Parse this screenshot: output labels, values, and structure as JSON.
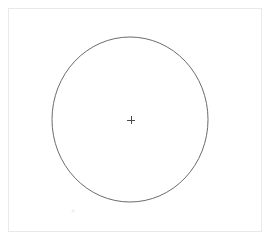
{
  "app": {
    "title": "Drawing Canvas",
    "background_color": "#ffffff"
  },
  "canvas": {
    "name": "drawing-canvas",
    "x": 8,
    "y": 8,
    "width": 254,
    "height": 224,
    "fill_color": "#ffffff",
    "border_color": "#e9e9e9",
    "border_width": 1
  },
  "shapes": [
    {
      "type": "ellipse",
      "name": "circle-shape",
      "label": "Circle",
      "center_x": 130,
      "center_y": 119.5,
      "radius_x": 78,
      "radius_y": 82.5,
      "stroke_color": "#5a5a5a",
      "stroke_width": 0.9,
      "fill": "none"
    },
    {
      "type": "crosshair",
      "name": "center-crosshair",
      "label": "+",
      "center_x": 131,
      "center_y": 120,
      "arm_length": 4,
      "stroke_color": "#4a4a4a",
      "stroke_width": 1
    },
    {
      "type": "dot",
      "name": "faint-speck",
      "center_x": 73,
      "center_y": 211,
      "radius": 1.6,
      "fill_color": "#efefef"
    }
  ]
}
